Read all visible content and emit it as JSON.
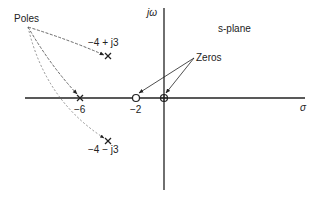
{
  "diagram": {
    "title": "s-plane",
    "axes": {
      "horizontal_label": "σ",
      "vertical_label": "jω"
    },
    "group_labels": {
      "poles": "Poles",
      "zeros": "Zeros"
    },
    "tick_labels": {
      "minus_six": "−6",
      "minus_two": "−2"
    },
    "poles": [
      {
        "label": "−4 + j3",
        "re": -4,
        "im": 3,
        "marker": "x"
      },
      {
        "label": "",
        "re": -6,
        "im": 0,
        "marker": "x"
      },
      {
        "label": "−4 − j3",
        "re": -4,
        "im": -3,
        "marker": "x"
      }
    ],
    "zeros": [
      {
        "re": -2,
        "im": 0,
        "marker": "o"
      },
      {
        "re": 0,
        "im": 0,
        "marker": "o"
      }
    ],
    "colors": {
      "ink": "#222222",
      "background": "#ffffff"
    }
  }
}
